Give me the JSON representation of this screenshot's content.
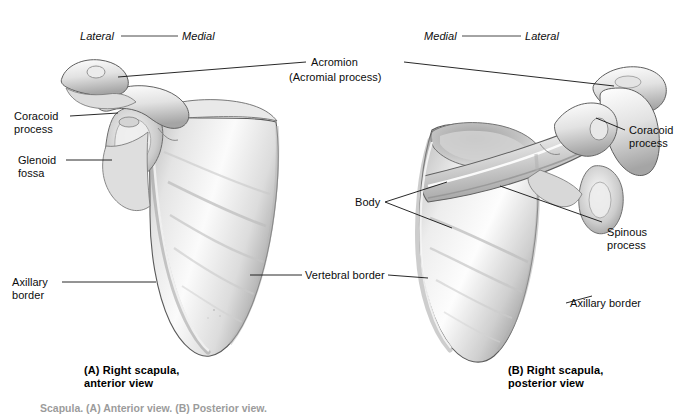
{
  "figure": {
    "title_footer": "Scapula. (A) Anterior view. (B) Posterior view.",
    "orientation_left": {
      "left_label": "Lateral",
      "right_label": "Medial"
    },
    "orientation_right": {
      "left_label": "Medial",
      "right_label": "Lateral"
    },
    "center_label": {
      "line1": "Acromion",
      "line2": "(Acromial process)"
    },
    "panels": [
      {
        "id": "A",
        "caption_line1": "(A) Right scapula,",
        "caption_line2": "anterior view",
        "labels": [
          {
            "name": "coracoid-process",
            "line1": "Coracoid",
            "line2": "process"
          },
          {
            "name": "glenoid-fossa",
            "line1": "Glenoid",
            "line2": "fossa"
          },
          {
            "name": "axillary-border",
            "line1": "Axillary",
            "line2": "border"
          },
          {
            "name": "vertebral-border",
            "line1": "Vertebral border",
            "line2": ""
          }
        ]
      },
      {
        "id": "B",
        "caption_line1": "(B) Right scapula,",
        "caption_line2": "posterior view",
        "labels": [
          {
            "name": "coracoid-process",
            "line1": "Coracoid",
            "line2": "process"
          },
          {
            "name": "spinous-process",
            "line1": "Spinous",
            "line2": "process"
          },
          {
            "name": "body",
            "line1": "Body",
            "line2": ""
          },
          {
            "name": "axillary-border",
            "line1": "Axillary border",
            "line2": ""
          }
        ]
      }
    ]
  },
  "colors": {
    "bone_light": "#fcfcfc",
    "bone_mid": "#d8d8d8",
    "bone_shadow": "#9a9a9a",
    "leader_line": "#111111",
    "text": "#0d0d0d",
    "background": "#ffffff"
  }
}
